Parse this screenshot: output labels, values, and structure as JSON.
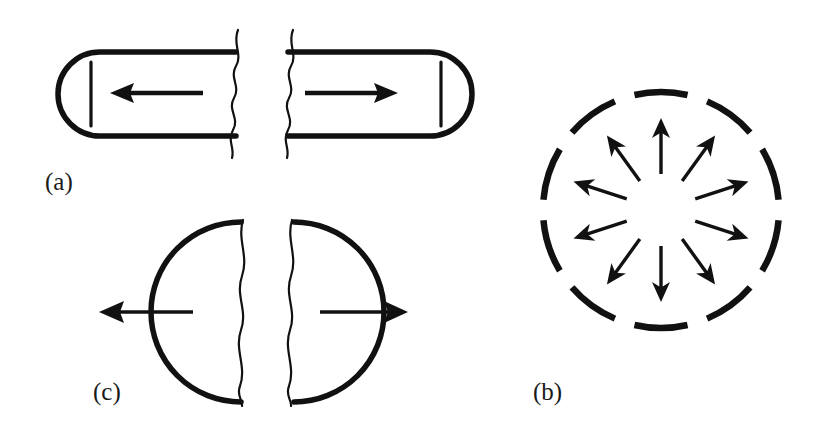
{
  "figure": {
    "background_color": "#ffffff",
    "ink_color": "#111111",
    "width": 835,
    "height": 431,
    "panels": [
      {
        "id": "a",
        "label": "(a)",
        "label_x": 45,
        "label_y": 190,
        "shape": "capsule",
        "description": "Split capsule with inward pointing arrows",
        "arrow_directions": [
          "left",
          "right"
        ]
      },
      {
        "id": "b",
        "label": "(b)",
        "label_x": 533,
        "label_y": 400,
        "shape": "dashed-circle",
        "description": "Dashed circle with radial outward arrows",
        "arrow_count": 10,
        "dash_count": 10,
        "circle_center_x": 661,
        "circle_center_y": 210,
        "circle_radius": 118
      },
      {
        "id": "c",
        "label": "(c)",
        "label_x": 93,
        "label_y": 400,
        "shape": "split-circle",
        "description": "Split circle halves with outward pointing arrows",
        "arrow_directions": [
          "left",
          "right"
        ]
      }
    ]
  },
  "chart_data": {
    "type": "diagram",
    "title": "",
    "panels": [
      {
        "id": "a",
        "label": "(a)",
        "geometry": "capsule",
        "capsule_top_y": 52,
        "capsule_bottom_y": 136,
        "left_cap_x": 58,
        "right_cap_x": 472,
        "break_x_left": 232,
        "break_x_right": 290,
        "ticks_x": [
          91,
          441
        ],
        "arrows": [
          {
            "from_x": 203,
            "to_x": 112,
            "y": 93,
            "direction": "left"
          },
          {
            "from_x": 305,
            "to_x": 396,
            "y": 93,
            "direction": "right"
          }
        ]
      },
      {
        "id": "b",
        "label": "(b)",
        "geometry": "dashed-circle",
        "center": [
          661,
          210
        ],
        "outer_radius": 118,
        "arrow_inner_radius": 36,
        "arrow_outer_radius": 92,
        "arrow_angles_deg": [
          90,
          126,
          162,
          198,
          234,
          270,
          306,
          342,
          18,
          54
        ],
        "dash_arc_span_deg": 26,
        "dash_gap_deg": 10
      },
      {
        "id": "c",
        "label": "(c)",
        "geometry": "split-circle",
        "center_y": 312,
        "left_half_center_x": 243,
        "right_half_center_x": 292,
        "circle_radius": 90,
        "break_x_left": 244,
        "break_x_right": 291,
        "arrows": [
          {
            "from_x": 192,
            "to_x": 100,
            "y": 312,
            "direction": "left"
          },
          {
            "from_x": 320,
            "to_x": 406,
            "y": 312,
            "direction": "right"
          }
        ]
      }
    ]
  }
}
